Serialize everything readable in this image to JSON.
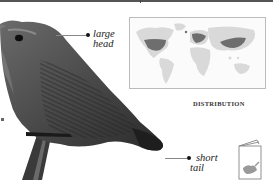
{
  "page": {
    "type": "field-guide-species-page",
    "subject_illustration": "wren-perched-on-stick"
  },
  "callouts": [
    {
      "id": "head",
      "line1": "large",
      "line2": "head"
    },
    {
      "id": "tail",
      "line1": "short",
      "line2": "tail"
    }
  ],
  "map": {
    "caption": "DISTRIBUTION",
    "icon": "world-map-icon",
    "colors": {
      "land": "#d9d9d9",
      "range": "#6e6e6e",
      "border": "#bbbbbb"
    }
  },
  "book_icon": {
    "icon": "book-icon",
    "fill": "#9a9a9a"
  },
  "colors": {
    "bird_dark": "#2e2e2e",
    "bird_mid": "#5a5a5a",
    "rule": "#555555"
  }
}
